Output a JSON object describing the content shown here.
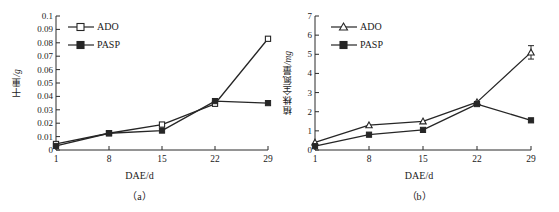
{
  "figure": {
    "panels": [
      {
        "caption": "（a）",
        "xlabel": "DAE/d",
        "ylabel_text": "干重",
        "ylabel_unit": "/g",
        "legend": [
          {
            "label": "ADO",
            "marker": "open-square"
          },
          {
            "label": "PASP",
            "marker": "filled-square"
          }
        ],
        "yticks": [
          "0",
          "0.01",
          "0.02",
          "0.03",
          "0.04",
          "0.05",
          "0.06",
          "0.07",
          "0.08",
          "0.09",
          "0.1"
        ],
        "xticks": [
          "1",
          "8",
          "15",
          "22",
          "29"
        ]
      },
      {
        "caption": "（b）",
        "xlabel": "DAE/d",
        "ylabel_text": "植株全氮量",
        "ylabel_unit": "/mg",
        "legend": [
          {
            "label": "ADO",
            "marker": "open-triangle"
          },
          {
            "label": "PASP",
            "marker": "filled-square"
          }
        ],
        "yticks": [
          "0",
          "1",
          "2",
          "3",
          "4",
          "5",
          "6",
          "7"
        ],
        "xticks": [
          "1",
          "8",
          "15",
          "22",
          "29"
        ]
      }
    ]
  },
  "chart_data": [
    {
      "type": "line",
      "panel": "a",
      "title": "",
      "xlabel": "DAE/d",
      "ylabel": "干重/g",
      "x": [
        1,
        8,
        15,
        22,
        29
      ],
      "xlim": [
        1,
        29
      ],
      "ylim": [
        0,
        0.1
      ],
      "ytick_step": 0.01,
      "grid": false,
      "legend_position": "top-left",
      "series": [
        {
          "name": "ADO",
          "marker": "open-square",
          "values": [
            0.0045,
            0.0125,
            0.019,
            0.0345,
            0.083
          ],
          "errors": [
            0,
            0,
            0,
            0.0015,
            0
          ]
        },
        {
          "name": "PASP",
          "marker": "filled-square",
          "values": [
            0.003,
            0.0125,
            0.0145,
            0.0365,
            0.035
          ],
          "errors": [
            0,
            0,
            0,
            0,
            0
          ]
        }
      ]
    },
    {
      "type": "line",
      "panel": "b",
      "title": "",
      "xlabel": "DAE/d",
      "ylabel": "植株全氮量/mg",
      "x": [
        1,
        8,
        15,
        22,
        29
      ],
      "xlim": [
        1,
        29
      ],
      "ylim": [
        0,
        7
      ],
      "ytick_step": 1,
      "grid": false,
      "legend_position": "top-left",
      "series": [
        {
          "name": "ADO",
          "marker": "open-triangle",
          "values": [
            0.4,
            1.3,
            1.5,
            2.5,
            5.1
          ],
          "errors": [
            0,
            0,
            0,
            0,
            0.35
          ]
        },
        {
          "name": "PASP",
          "marker": "filled-square",
          "values": [
            0.2,
            0.8,
            1.05,
            2.4,
            1.55
          ],
          "errors": [
            0,
            0,
            0,
            0,
            0
          ]
        }
      ]
    }
  ],
  "style": {
    "line_color": "#262626",
    "axis_color": "#2b2b2b",
    "text_color": "#1a1a1a"
  }
}
